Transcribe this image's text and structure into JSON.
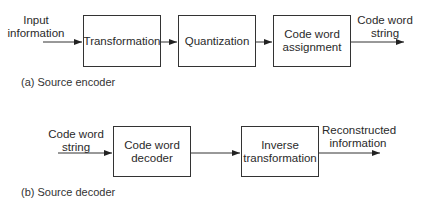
{
  "encoder": {
    "caption": "(a) Source encoder",
    "input_label_line1": "Input",
    "input_label_line2": "information",
    "blocks": [
      {
        "line1": "Transformation",
        "line2": ""
      },
      {
        "line1": "Quantization",
        "line2": ""
      },
      {
        "line1": "Code word",
        "line2": "assignment"
      }
    ],
    "output_label_line1": "Code word",
    "output_label_line2": "string"
  },
  "decoder": {
    "caption": "(b) Source decoder",
    "input_label_line1": "Code word",
    "input_label_line2": "string",
    "blocks": [
      {
        "line1": "Code word",
        "line2": "decoder"
      },
      {
        "line1": "Inverse",
        "line2": "transformation"
      }
    ],
    "output_label_line1": "Reconstructed",
    "output_label_line2": "information"
  }
}
